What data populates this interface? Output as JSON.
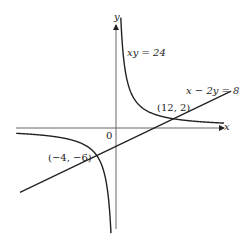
{
  "chart_data": {
    "type": "line",
    "title": "",
    "xlabel": "x",
    "ylabel": "y",
    "origin_label": "0",
    "grid": false,
    "axis_ranges": {
      "x": [
        -20,
        27
      ],
      "y": [
        -25,
        24
      ]
    },
    "series": [
      {
        "name": "xy = 24",
        "kind": "hyperbola",
        "equation": "xy = 24",
        "points_branch_positive": [
          [
            1,
            24
          ],
          [
            2,
            12
          ],
          [
            3,
            8
          ],
          [
            4,
            6
          ],
          [
            6,
            4
          ],
          [
            8,
            3
          ],
          [
            12,
            2
          ],
          [
            16,
            1.5
          ],
          [
            20,
            1.2
          ],
          [
            24,
            1
          ]
        ],
        "points_branch_negative": [
          [
            -20,
            -1.2
          ],
          [
            -12,
            -2
          ],
          [
            -8,
            -3
          ],
          [
            -6,
            -4
          ],
          [
            -4,
            -6
          ],
          [
            -3,
            -8
          ],
          [
            -2,
            -12
          ],
          [
            -1.2,
            -20
          ],
          [
            -1,
            -24
          ]
        ]
      },
      {
        "name": "x − 2y = 8",
        "kind": "line",
        "equation": "x - 2y = 8",
        "points": [
          [
            -20,
            -14
          ],
          [
            24,
            8
          ]
        ]
      }
    ],
    "annotations": [
      {
        "text": "(12, 2)",
        "x": 12,
        "y": 2
      },
      {
        "text": "(−4, −6)",
        "x": -4,
        "y": -6
      }
    ],
    "legend": null
  },
  "labels": {
    "y_axis": "y",
    "x_axis": "x",
    "origin": "0",
    "curve": "xy = 24",
    "line": "x − 2y = 8",
    "point1": "(12, 2)",
    "point2": "(−4, −6)"
  }
}
